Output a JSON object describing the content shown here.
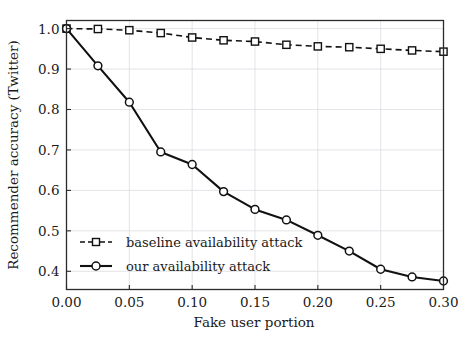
{
  "chart_data": {
    "type": "line",
    "title": "",
    "xlabel": "Fake user portion",
    "ylabel": "Recommender accuracy (Twitter)",
    "xlim": [
      0.0,
      0.3
    ],
    "ylim": [
      0.355,
      1.02
    ],
    "grid": true,
    "legend_position": "lower left",
    "x": [
      0.0,
      0.025,
      0.05,
      0.075,
      0.1,
      0.125,
      0.15,
      0.175,
      0.2,
      0.225,
      0.25,
      0.275,
      0.3
    ],
    "xticks": [
      0.0,
      0.05,
      0.1,
      0.15,
      0.2,
      0.25,
      0.3
    ],
    "xtick_labels": [
      "0.00",
      "0.05",
      "0.10",
      "0.15",
      "0.20",
      "0.25",
      "0.30"
    ],
    "yticks": [
      0.4,
      0.5,
      0.6,
      0.7,
      0.8,
      0.9,
      1.0
    ],
    "ytick_labels": [
      "0.4",
      "0.5",
      "0.6",
      "0.7",
      "0.8",
      "0.9",
      "1.0"
    ],
    "series": [
      {
        "name": "baseline availability attack",
        "marker": "square",
        "linestyle": "dashed",
        "color": "#111111",
        "values": [
          1.0,
          0.999,
          0.996,
          0.989,
          0.978,
          0.971,
          0.968,
          0.96,
          0.956,
          0.954,
          0.95,
          0.946,
          0.943
        ]
      },
      {
        "name": "our availability attack",
        "marker": "circle",
        "linestyle": "solid",
        "color": "#111111",
        "values": [
          1.0,
          0.908,
          0.818,
          0.695,
          0.664,
          0.597,
          0.553,
          0.527,
          0.489,
          0.45,
          0.405,
          0.386,
          0.376
        ]
      }
    ]
  },
  "legend": {
    "entries": [
      {
        "label": "baseline availability attack",
        "marker": "square-marker",
        "style": "dashed"
      },
      {
        "label": "our availability attack",
        "marker": "circle-marker",
        "style": "solid"
      }
    ]
  }
}
